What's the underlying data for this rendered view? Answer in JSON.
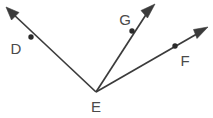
{
  "figure": {
    "background_color": "#ffffff",
    "stroke_color": "#3b3b3b",
    "label_color": "#4a4a4a",
    "dot_color": "#2b2b2b",
    "width": 213,
    "height": 118
  },
  "vertex": {
    "name": "E",
    "label": "E",
    "x": 96,
    "y": 92,
    "label_x": 96,
    "label_y": 112
  },
  "rays": [
    {
      "id": "ray-ed",
      "label": "D",
      "through_point": {
        "label": "D",
        "x": 31,
        "y": 37
      },
      "tip": {
        "x": 6,
        "y": 7
      },
      "label_pos": {
        "x": 16,
        "y": 54
      },
      "arrow_angle_deg": 220.5
    },
    {
      "id": "ray-eg",
      "label": "G",
      "through_point": {
        "label": "G",
        "x": 132,
        "y": 31
      },
      "tip": {
        "x": 155,
        "y": 4
      },
      "label_pos": {
        "x": 125,
        "y": 25
      },
      "arrow_angle_deg": 310.5
    },
    {
      "id": "ray-ef",
      "label": "F",
      "through_point": {
        "label": "F",
        "x": 175,
        "y": 46
      },
      "tip": {
        "x": 208,
        "y": 27
      },
      "label_pos": {
        "x": 185,
        "y": 66
      },
      "arrow_angle_deg": 330.0
    }
  ],
  "labels": {
    "d": "D",
    "e": "E",
    "f": "F",
    "g": "G"
  }
}
